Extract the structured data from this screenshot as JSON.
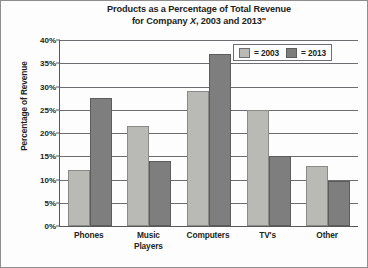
{
  "chart_data": {
    "type": "bar",
    "title": "Products as a Percentage of Total Revenue for Company X, 2003 and 2013\"",
    "title_line1": "Products as a Percentage of Total Revenue",
    "title_line2_pre": "for Company ",
    "title_line2_italic": "X",
    "title_line2_post": ", 2003 and 2013\"",
    "xlabel": "",
    "ylabel": "Percentage of Revenue",
    "ylim": [
      0,
      40
    ],
    "ytick_labels": [
      "40%",
      "35%",
      "30%",
      "25%",
      "20%",
      "15%",
      "10%",
      "5%",
      "0%"
    ],
    "ytick_values": [
      40,
      35,
      30,
      25,
      20,
      15,
      10,
      5,
      0
    ],
    "grid": true,
    "legend_position": "top-right",
    "categories": [
      "Phones",
      "Music Players",
      "Computers",
      "TV's",
      "Other"
    ],
    "category_lines": [
      [
        "Phones"
      ],
      [
        "Music",
        "Players"
      ],
      [
        "Computers"
      ],
      [
        "TV's"
      ],
      [
        "Other"
      ]
    ],
    "series": [
      {
        "name": "2003",
        "legend_label": "= 2003",
        "color": "#b9b9b5",
        "values": [
          12,
          21.5,
          29,
          25,
          13
        ]
      },
      {
        "name": "2013",
        "legend_label": "= 2013",
        "color": "#7e7e7e",
        "values": [
          27.5,
          14,
          37,
          15,
          9.7
        ]
      }
    ]
  }
}
